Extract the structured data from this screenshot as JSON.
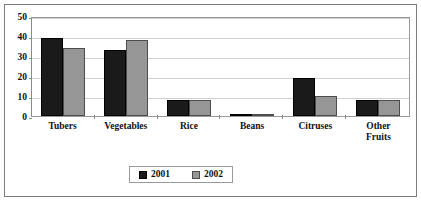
{
  "chart_data": {
    "type": "bar",
    "title": "",
    "subtitle": "",
    "xlabel": "",
    "ylabel": "",
    "ylim": [
      0,
      50
    ],
    "ytick_step": 10,
    "yticks": [
      "0",
      "10",
      "20",
      "30",
      "40",
      "50"
    ],
    "grid": true,
    "legend_position": "bottom",
    "categories": [
      "Tubers",
      "Vegetables",
      "Rice",
      "Beans",
      "Citruses",
      "Other Fruits"
    ],
    "category_labels": [
      [
        "Tubers"
      ],
      [
        "Vegetables"
      ],
      [
        "Rice"
      ],
      [
        "Beans"
      ],
      [
        "Citruses"
      ],
      [
        "Other",
        "Fruits"
      ]
    ],
    "series": [
      {
        "name": "2001",
        "color": "#1a1a1a",
        "values": [
          39,
          33,
          8,
          1,
          19,
          8
        ]
      },
      {
        "name": "2002",
        "color": "#969696",
        "values": [
          34,
          38,
          8,
          1,
          10,
          8
        ]
      }
    ]
  },
  "legend": {
    "entries": [
      {
        "label": "2001"
      },
      {
        "label": "2002"
      }
    ]
  },
  "colors": {
    "series_2001": "#1a1a1a",
    "series_2002": "#969696",
    "grid": "#d0d0d0",
    "frame": "#7d7d7d",
    "axis": "#8a8a8a",
    "text": "#111111",
    "background": "#ffffff"
  }
}
